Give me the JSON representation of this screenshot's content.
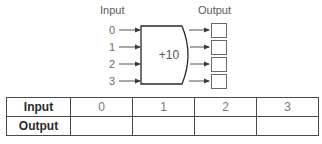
{
  "diagram": {
    "input_label": "Input",
    "output_label": "Output",
    "operation": "+10",
    "inputs": [
      "0",
      "1",
      "2",
      "3"
    ],
    "outputs": [
      "",
      "",
      "",
      ""
    ]
  },
  "table": {
    "row_headers": [
      "Input",
      "Output"
    ],
    "input_values": [
      "0",
      "1",
      "2",
      "3"
    ],
    "output_values": [
      "",
      "",
      "",
      ""
    ]
  },
  "colors": {
    "stroke": "#2a2a2a",
    "text": "#555555",
    "light_text": "#777777",
    "background": "#ffffff"
  }
}
